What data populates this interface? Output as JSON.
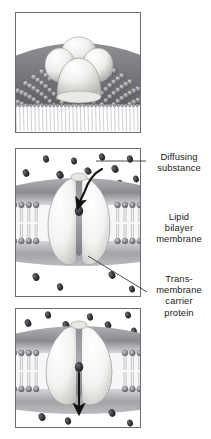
{
  "figure": {
    "background_color": "#ffffff",
    "frame_color": "#6e6e72",
    "text_color": "#1d1d1d",
    "membrane_head_color": "#8d8d92",
    "membrane_tail_color": "#f4f4f4",
    "protein_color": "#f2f2ef",
    "particle_color": "#2e2e33",
    "arrow_color": "#111111"
  },
  "panels": [
    {
      "id": "panel-1",
      "name": "surface-view-panel",
      "caption": "",
      "description": "Three-dimensional surface view of a globular transmembrane carrier protein bulging out of a cobblestone-textured lipid bilayer membrane, with lipid tails visible at the cut edge below."
    },
    {
      "id": "panel-2",
      "name": "binding-panel",
      "caption": "",
      "description": "Cross-section of the carrier protein with its channel open to the outside; a diffusing substance particle enters from above along a curved arrow and binds inside the channel."
    },
    {
      "id": "panel-3",
      "name": "release-panel",
      "caption": "",
      "description": "Cross-section of the carrier protein with its channel open to the inside; the bound particle is released downward along a straight arrow into the cell interior."
    }
  ],
  "labels": [
    {
      "id": "label-diffusing",
      "name": "diffusing-substance-label",
      "text": "Diffusing\nsubstance",
      "lines": [
        "Diffusing",
        "substance"
      ],
      "leader": "horizontal"
    },
    {
      "id": "label-lipid",
      "name": "lipid-bilayer-membrane-label",
      "text": "Lipid\nbilayer\nmembrane",
      "lines": [
        "Lipid",
        "bilayer",
        "membrane"
      ],
      "leader": "none"
    },
    {
      "id": "label-protein",
      "name": "transmembrane-carrier-protein-label",
      "text": "Trans-\nmembrane\ncarrier\nprotein",
      "lines": [
        "Trans-",
        "membrane",
        "carrier",
        "protein"
      ],
      "leader": "diagonal"
    }
  ]
}
